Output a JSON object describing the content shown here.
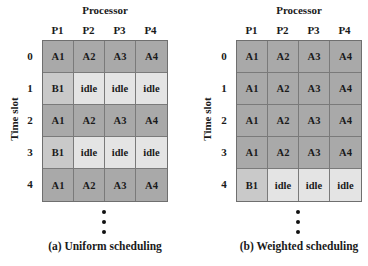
{
  "panels": [
    {
      "processor_title": "Processor",
      "columns": [
        "P1",
        "P2",
        "P3",
        "P4"
      ],
      "time_label": "Time slot",
      "rows": [
        {
          "slot": "0",
          "cells": [
            {
              "t": "A1",
              "k": "a"
            },
            {
              "t": "A2",
              "k": "a"
            },
            {
              "t": "A3",
              "k": "a"
            },
            {
              "t": "A4",
              "k": "a"
            }
          ]
        },
        {
          "slot": "1",
          "cells": [
            {
              "t": "B1",
              "k": "b"
            },
            {
              "t": "idle",
              "k": "idle"
            },
            {
              "t": "idle",
              "k": "idle"
            },
            {
              "t": "idle",
              "k": "idle"
            }
          ]
        },
        {
          "slot": "2",
          "cells": [
            {
              "t": "A1",
              "k": "a"
            },
            {
              "t": "A2",
              "k": "a"
            },
            {
              "t": "A3",
              "k": "a"
            },
            {
              "t": "A4",
              "k": "a"
            }
          ]
        },
        {
          "slot": "3",
          "cells": [
            {
              "t": "B1",
              "k": "b"
            },
            {
              "t": "idle",
              "k": "idle"
            },
            {
              "t": "idle",
              "k": "idle"
            },
            {
              "t": "idle",
              "k": "idle"
            }
          ]
        },
        {
          "slot": "4",
          "cells": [
            {
              "t": "A1",
              "k": "a"
            },
            {
              "t": "A2",
              "k": "a"
            },
            {
              "t": "A3",
              "k": "a"
            },
            {
              "t": "A4",
              "k": "a"
            }
          ]
        }
      ],
      "caption": "(a) Uniform scheduling"
    },
    {
      "processor_title": "Processor",
      "columns": [
        "P1",
        "P2",
        "P3",
        "P4"
      ],
      "time_label": "Time slot",
      "rows": [
        {
          "slot": "0",
          "cells": [
            {
              "t": "A1",
              "k": "a"
            },
            {
              "t": "A2",
              "k": "a"
            },
            {
              "t": "A3",
              "k": "a"
            },
            {
              "t": "A4",
              "k": "a"
            }
          ]
        },
        {
          "slot": "1",
          "cells": [
            {
              "t": "A1",
              "k": "a"
            },
            {
              "t": "A2",
              "k": "a"
            },
            {
              "t": "A3",
              "k": "a"
            },
            {
              "t": "A4",
              "k": "a"
            }
          ]
        },
        {
          "slot": "2",
          "cells": [
            {
              "t": "A1",
              "k": "a"
            },
            {
              "t": "A2",
              "k": "a"
            },
            {
              "t": "A3",
              "k": "a"
            },
            {
              "t": "A4",
              "k": "a"
            }
          ]
        },
        {
          "slot": "3",
          "cells": [
            {
              "t": "A1",
              "k": "a"
            },
            {
              "t": "A2",
              "k": "a"
            },
            {
              "t": "A3",
              "k": "a"
            },
            {
              "t": "A4",
              "k": "a"
            }
          ]
        },
        {
          "slot": "4",
          "cells": [
            {
              "t": "B1",
              "k": "b"
            },
            {
              "t": "idle",
              "k": "idle"
            },
            {
              "t": "idle",
              "k": "idle"
            },
            {
              "t": "idle",
              "k": "idle"
            }
          ]
        }
      ],
      "caption": "(b) Weighted scheduling"
    }
  ],
  "colors": {
    "task_a": "#a9a9a9",
    "task_b": "#c9c9c9",
    "idle": "#e4e4e4",
    "border": "#7a7a7a"
  }
}
